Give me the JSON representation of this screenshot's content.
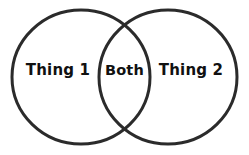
{
  "figure": {
    "type": "venn-diagram",
    "background_color": "#ffffff",
    "stroke_color": "#2b2b2b",
    "stroke_width": 3,
    "fill_color": "#ffffff",
    "text_color": "#111111"
  },
  "labels": {
    "left": "Thing 1",
    "overlap": "Both",
    "right": "Thing 2"
  },
  "geometry": {
    "canvas_width": 249,
    "canvas_height": 155,
    "left_ellipse": {
      "cx": 81,
      "cy": 77,
      "rx": 69,
      "ry": 67
    },
    "right_ellipse": {
      "cx": 168,
      "cy": 77,
      "rx": 69,
      "ry": 67
    }
  }
}
